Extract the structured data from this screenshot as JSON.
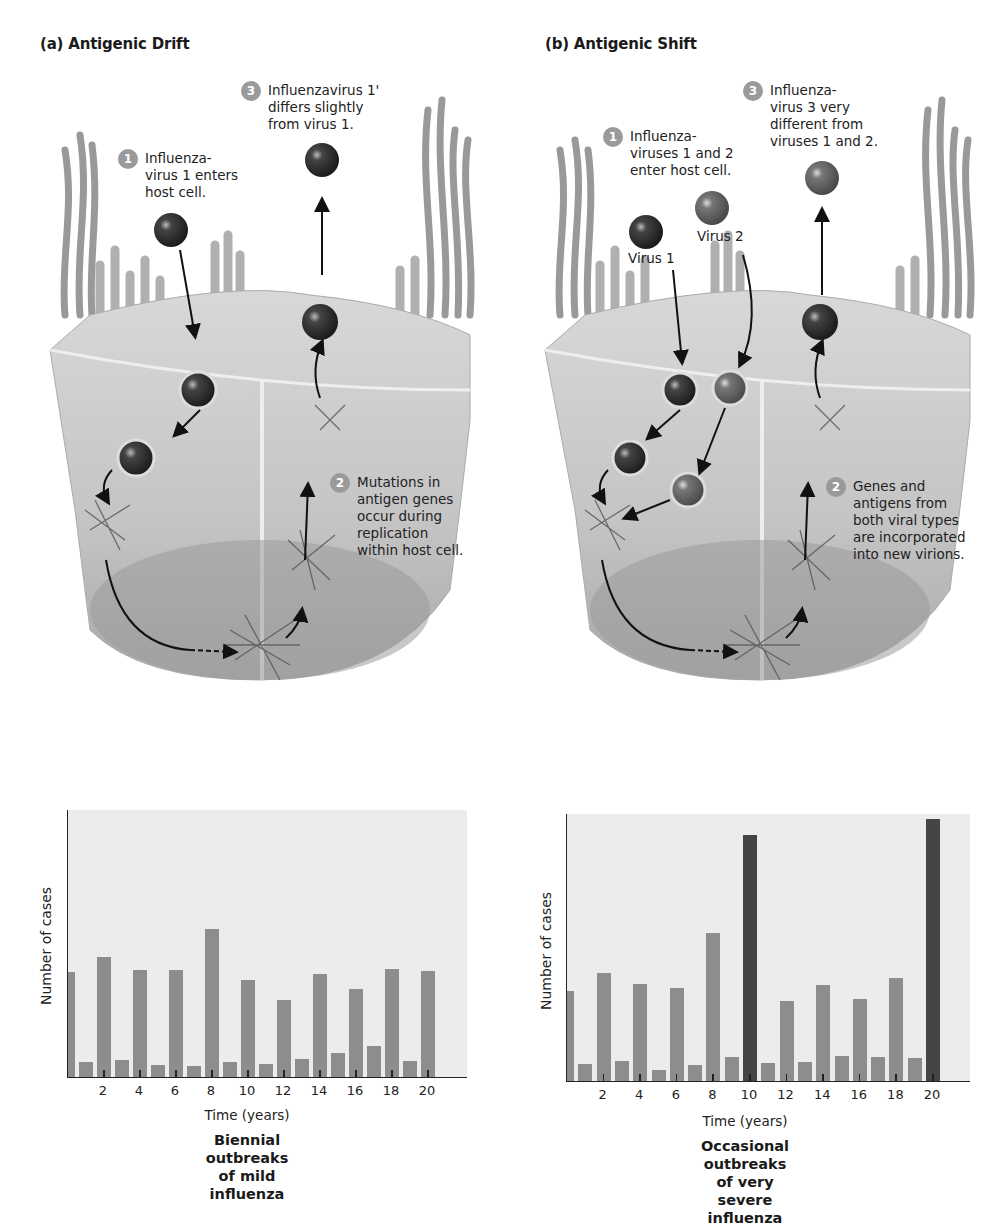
{
  "panels": [
    {
      "id": "a",
      "title": "(a) Antigenic Drift",
      "steps": [
        {
          "num": "1",
          "text": "Influenza-\nvirus 1 enters\nhost cell."
        },
        {
          "num": "2",
          "text": "Mutations in\nantigen genes\noccur during\nreplication\nwithin host cell."
        },
        {
          "num": "3",
          "text": "Influenzavirus 1'\ndiffers slightly\nfrom virus 1."
        }
      ],
      "chart": {
        "ylabel": "Number of cases",
        "xlabel": "Time (years)",
        "caption": "Biennial outbreaks\nof mild influenza"
      }
    },
    {
      "id": "b",
      "title": "(b) Antigenic Shift",
      "steps": [
        {
          "num": "1",
          "text": "Influenza-\nviruses 1 and 2\nenter host cell."
        },
        {
          "num": "2",
          "text": "Genes and\nantigens from\nboth viral types\nare incorporated\ninto new virions."
        },
        {
          "num": "3",
          "text": "Influenza-\nvirus 3 very\ndifferent from\nviruses 1 and 2."
        }
      ],
      "virus_labels": [
        "Virus 1",
        "Virus 2"
      ],
      "chart": {
        "ylabel": "Number of cases",
        "xlabel": "Time (years)",
        "caption": "Occasional outbreaks\nof very severe influenza"
      }
    }
  ],
  "colors": {
    "bar_mild": "#8d8d8d",
    "bar_severe": "#454545",
    "plot_bg": "#ececec",
    "step_badge": "#9a9a9a"
  },
  "chart_data": [
    {
      "type": "bar",
      "title": "Biennial outbreaks of mild influenza",
      "xlabel": "Time (years)",
      "ylabel": "Number of cases",
      "x": [
        0,
        1,
        2,
        3,
        4,
        5,
        6,
        7,
        8,
        9,
        10,
        11,
        12,
        13,
        14,
        15,
        16,
        17,
        18,
        19,
        20
      ],
      "xticks": [
        2,
        4,
        6,
        8,
        10,
        12,
        14,
        16,
        18,
        20
      ],
      "values": [
        105,
        15,
        120,
        17,
        107,
        12,
        107,
        11,
        148,
        15,
        97,
        13,
        77,
        18,
        103,
        24,
        88,
        31,
        108,
        16,
        106
      ],
      "severe": [],
      "ylim": [
        0,
        267
      ],
      "grid": false,
      "yticks_shown": false
    },
    {
      "type": "bar",
      "title": "Occasional outbreaks of very severe influenza",
      "xlabel": "Time (years)",
      "ylabel": "Number of cases",
      "x": [
        0,
        1,
        2,
        3,
        4,
        5,
        6,
        7,
        8,
        9,
        10,
        11,
        12,
        13,
        14,
        15,
        16,
        17,
        18,
        19,
        20
      ],
      "xticks": [
        2,
        4,
        6,
        8,
        10,
        12,
        14,
        16,
        18,
        20
      ],
      "values": [
        90,
        17,
        108,
        20,
        97,
        11,
        93,
        16,
        148,
        24,
        246,
        18,
        80,
        19,
        96,
        25,
        82,
        24,
        103,
        23,
        262
      ],
      "severe": [
        10,
        20
      ],
      "ylim": [
        0,
        267
      ],
      "grid": false,
      "yticks_shown": false
    }
  ]
}
